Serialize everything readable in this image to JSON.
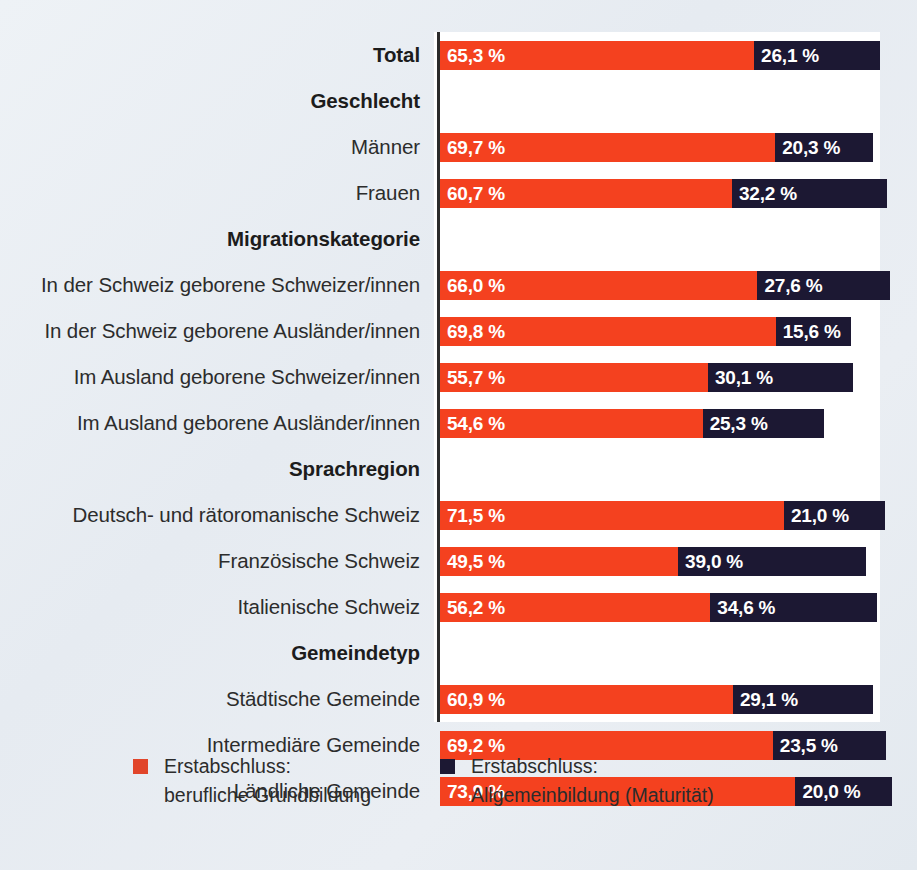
{
  "chart_data": {
    "type": "bar",
    "orientation": "horizontal",
    "stacked": true,
    "title": "",
    "xlabel": "",
    "ylabel": "",
    "xlim": [
      0,
      100
    ],
    "grid": false,
    "legend_position": "bottom",
    "unit": "%",
    "decimal_separator": ",",
    "colors": {
      "series_a": "#f4411f",
      "series_b": "#1c1833",
      "panel": "#ffffff",
      "background": "#e9eef3",
      "axis": "#2b2b2b",
      "label_text": "#2c2c2c",
      "value_text": "#ffffff"
    },
    "series": [
      {
        "name": "Erstabschluss: berufliche Grundbildung",
        "color": "#f4411f",
        "values": [
          65.3,
          null,
          69.7,
          60.7,
          null,
          66.0,
          69.8,
          55.7,
          54.6,
          null,
          71.5,
          49.5,
          56.2,
          null,
          60.9,
          69.2,
          73.9
        ]
      },
      {
        "name": "Erstabschluss: Allgemeinbildung (Maturität)",
        "color": "#1c1833",
        "values": [
          26.1,
          null,
          20.3,
          32.2,
          null,
          27.6,
          15.6,
          30.1,
          25.3,
          null,
          21.0,
          39.0,
          34.6,
          null,
          29.1,
          23.5,
          20.0
        ]
      }
    ],
    "categories": [
      "Total",
      "Geschlecht",
      "Männer",
      "Frauen",
      "Migrationskategorie",
      "In der Schweiz geborene Schweizer/innen",
      "In der Schweiz geborene Ausländer/innen",
      "Im Ausland geborene Schweizer/innen",
      "Im Ausland geborene Ausländer/innen",
      "Sprachregion",
      "Deutsch- und rätoromanische Schweiz",
      "Französische Schweiz",
      "Italienische Schweiz",
      "Gemeindetyp",
      "Städtische Gemeinde",
      "Intermediäre Gemeinde",
      "Ländliche Gemeinde"
    ],
    "rows": [
      {
        "label": "Total",
        "kind": "total",
        "a": 65.3,
        "b": 26.1,
        "a_text": "65,3 %",
        "b_text": "26,1 %"
      },
      {
        "label": "Geschlecht",
        "kind": "group",
        "a": null,
        "b": null,
        "a_text": "",
        "b_text": ""
      },
      {
        "label": "Männer",
        "kind": "item",
        "a": 69.7,
        "b": 20.3,
        "a_text": "69,7 %",
        "b_text": "20,3 %"
      },
      {
        "label": "Frauen",
        "kind": "item",
        "a": 60.7,
        "b": 32.2,
        "a_text": "60,7 %",
        "b_text": "32,2 %"
      },
      {
        "label": "Migrationskategorie",
        "kind": "group",
        "a": null,
        "b": null,
        "a_text": "",
        "b_text": ""
      },
      {
        "label": "In der Schweiz geborene Schweizer/innen",
        "kind": "item",
        "a": 66.0,
        "b": 27.6,
        "a_text": "66,0 %",
        "b_text": "27,6 %"
      },
      {
        "label": "In der Schweiz geborene Ausländer/innen",
        "kind": "item",
        "a": 69.8,
        "b": 15.6,
        "a_text": "69,8 %",
        "b_text": "15,6 %"
      },
      {
        "label": "Im Ausland geborene Schweizer/innen",
        "kind": "item",
        "a": 55.7,
        "b": 30.1,
        "a_text": "55,7 %",
        "b_text": "30,1 %"
      },
      {
        "label": "Im Ausland geborene Ausländer/innen",
        "kind": "item",
        "a": 54.6,
        "b": 25.3,
        "a_text": "54,6 %",
        "b_text": "25,3 %"
      },
      {
        "label": "Sprachregion",
        "kind": "group",
        "a": null,
        "b": null,
        "a_text": "",
        "b_text": ""
      },
      {
        "label": "Deutsch- und rätoromanische Schweiz",
        "kind": "item",
        "a": 71.5,
        "b": 21.0,
        "a_text": "71,5 %",
        "b_text": "21,0 %"
      },
      {
        "label": "Französische Schweiz",
        "kind": "item",
        "a": 49.5,
        "b": 39.0,
        "a_text": "49,5 %",
        "b_text": "39,0 %"
      },
      {
        "label": "Italienische Schweiz",
        "kind": "item",
        "a": 56.2,
        "b": 34.6,
        "a_text": "56,2 %",
        "b_text": "34,6 %"
      },
      {
        "label": "Gemeindetyp",
        "kind": "group",
        "a": null,
        "b": null,
        "a_text": "",
        "b_text": ""
      },
      {
        "label": "Städtische Gemeinde",
        "kind": "item",
        "a": 60.9,
        "b": 29.1,
        "a_text": "60,9 %",
        "b_text": "29,1 %"
      },
      {
        "label": "Intermediäre Gemeinde",
        "kind": "item",
        "a": 69.2,
        "b": 23.5,
        "a_text": "69,2 %",
        "b_text": "23,5 %"
      },
      {
        "label": "Ländliche Gemeinde",
        "kind": "item",
        "a": 73.9,
        "b": 20.0,
        "a_text": "73,9 %",
        "b_text": "20,0 %"
      }
    ],
    "legend": [
      {
        "swatch": "#f4411f",
        "line1": "Erstabschluss:",
        "line2": "berufliche Grundbildung"
      },
      {
        "swatch": "#1c1833",
        "line1": "Erstabschluss:",
        "line2": "Allgemeinbildung (Maturität)"
      }
    ]
  }
}
